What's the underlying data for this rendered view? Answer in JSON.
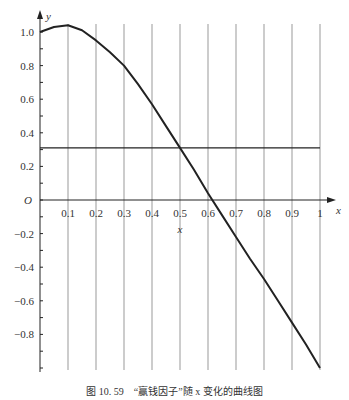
{
  "chart_data": {
    "type": "line",
    "title": "",
    "xlabel": "x",
    "ylabel": "y",
    "origin_label": "O",
    "xlim": [
      0,
      1
    ],
    "ylim": [
      -1.0,
      1.1
    ],
    "x_ticks": [
      "0.1",
      "0.2",
      "0.3",
      "0.4",
      "0.5",
      "0.6",
      "0.7",
      "0.8",
      "0.9",
      "1"
    ],
    "y_ticks": [
      "1.0",
      "0.8",
      "0.6",
      "0.4",
      "0.2",
      "-0.2",
      "-0.4",
      "-0.6",
      "-0.8"
    ],
    "y_tick_values": [
      1.0,
      0.8,
      0.6,
      0.4,
      0.2,
      -0.2,
      -0.4,
      -0.6,
      -0.8
    ],
    "grid": "vertical lines at each x tick",
    "series": [
      {
        "name": "赢钱因子",
        "x": [
          0,
          0.05,
          0.1,
          0.15,
          0.2,
          0.25,
          0.3,
          0.35,
          0.4,
          0.45,
          0.5,
          0.55,
          0.6,
          0.65,
          0.7,
          0.75,
          0.8,
          0.85,
          0.9,
          0.95,
          1.0
        ],
        "values": [
          1.0,
          1.03,
          1.04,
          1.01,
          0.95,
          0.88,
          0.8,
          0.69,
          0.57,
          0.44,
          0.31,
          0.18,
          0.04,
          -0.09,
          -0.22,
          -0.35,
          -0.47,
          -0.6,
          -0.73,
          -0.86,
          -1.0
        ]
      },
      {
        "name": "horizontal reference",
        "x": [
          0,
          1
        ],
        "values": [
          0.31,
          0.31
        ]
      }
    ],
    "annotations": [
      "x label under 0.5 tick"
    ]
  },
  "caption": "图 10. 59　“赢钱因子”随 x 变化的曲线图"
}
